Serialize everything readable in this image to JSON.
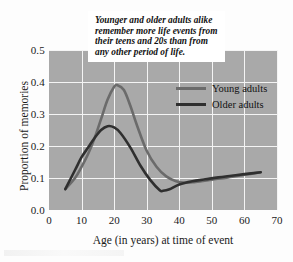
{
  "figure": {
    "caption_callout": "Younger and older adults alike\nremember more life events from\ntheir teens and 20s than from\nany other period of life.",
    "background_color": "#fdfdfd",
    "plot_background_color": "#a9a9a9",
    "gridline_color": "#f4f4f4"
  },
  "legend": {
    "position": "inside-top-right",
    "entries": [
      {
        "label": "Young adults",
        "color": "#6b6b6b"
      },
      {
        "label": "Older adults",
        "color": "#2f2f2f"
      }
    ]
  },
  "axes": {
    "y_tick_labels": [
      "0.5",
      "0.4",
      "0.3",
      "0.2",
      "0.1",
      "0.0"
    ],
    "x_tick_labels": [
      "0",
      "10",
      "20",
      "30",
      "40",
      "50",
      "60",
      "70"
    ],
    "x_title": "Age (in years) at time of event",
    "y_title": "Proportion of memories"
  },
  "chart_data": {
    "type": "line",
    "title": "",
    "subtitle": "",
    "annotations": [
      "Younger and older adults alike remember more life events from their teens and 20s than from any other period of life."
    ],
    "xlabel": "Age (in years) at time of event",
    "ylabel": "Proportion of memories",
    "xlim": [
      0,
      70
    ],
    "ylim": [
      0.0,
      0.5
    ],
    "xticks": [
      0,
      10,
      20,
      30,
      40,
      50,
      60,
      70
    ],
    "yticks": [
      0.0,
      0.1,
      0.2,
      0.3,
      0.4,
      0.5
    ],
    "grid": true,
    "legend_position": "upper right",
    "series": [
      {
        "name": "Young adults",
        "color": "#6b6b6b",
        "x": [
          5,
          8,
          10,
          12,
          14,
          16,
          18,
          20,
          21,
          23,
          25,
          27,
          30,
          33,
          36,
          39,
          42,
          45,
          50,
          55,
          60,
          65
        ],
        "y": [
          0.065,
          0.1,
          0.135,
          0.175,
          0.225,
          0.285,
          0.345,
          0.385,
          0.39,
          0.375,
          0.325,
          0.265,
          0.185,
          0.135,
          0.105,
          0.09,
          0.085,
          0.088,
          0.095,
          0.102,
          0.11,
          0.118
        ]
      },
      {
        "name": "Older adults",
        "color": "#2f2f2f",
        "x": [
          5,
          8,
          10,
          12,
          14,
          16,
          18,
          20,
          22,
          25,
          28,
          31,
          34,
          35,
          37,
          40,
          44,
          48,
          52,
          56,
          60,
          65
        ],
        "y": [
          0.065,
          0.125,
          0.165,
          0.195,
          0.225,
          0.25,
          0.262,
          0.258,
          0.24,
          0.195,
          0.14,
          0.095,
          0.062,
          0.06,
          0.065,
          0.08,
          0.09,
          0.096,
          0.102,
          0.107,
          0.112,
          0.118
        ]
      }
    ]
  }
}
